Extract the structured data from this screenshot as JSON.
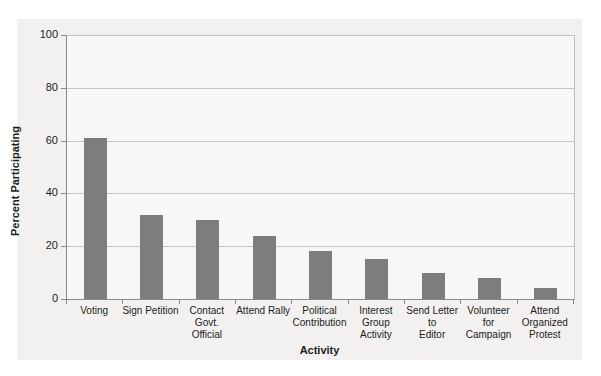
{
  "chart_data": {
    "type": "bar",
    "title": "",
    "xlabel": "Activity",
    "ylabel": "Percent Participating",
    "categories": [
      "Voting",
      "Sign Petition",
      "Contact\nGovt.\nOfficial",
      "Attend Rally",
      "Political\nContribution",
      "Interest\nGroup\nActivity",
      "Send Letter\nto\nEditor",
      "Volunteer\nfor\nCampaign",
      "Attend\nOrganized\nProtest"
    ],
    "values": [
      61,
      32,
      30,
      24,
      18,
      15,
      10,
      8,
      4
    ],
    "ylim": [
      0,
      100
    ],
    "yticks": [
      0,
      20,
      40,
      60,
      80,
      100
    ],
    "grid": true,
    "legend": "none",
    "bar_color": "#7d7d7d",
    "gridline_color": "#c4c4c4",
    "axis_color": "#8a8a8a",
    "frame_color": "#bdbdbd",
    "figure_bg": "#f2f1ef",
    "plot_bg": "#f8f7f5",
    "text_color": "#1c1c1c"
  }
}
